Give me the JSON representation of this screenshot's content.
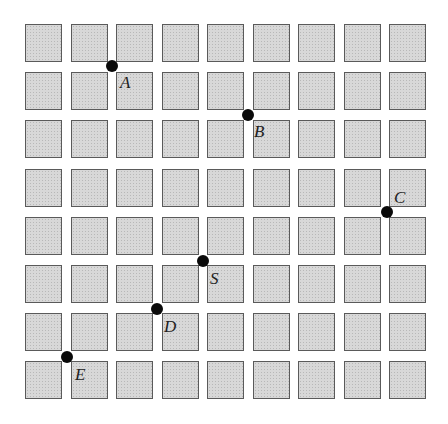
{
  "diagram": {
    "type": "grid-of-squares",
    "columns": 9,
    "rows": 8,
    "colors": {
      "square_fill": "#d8d8d8",
      "square_border": "#5a5a5a",
      "dot": "#0a0a0a",
      "label": "#222222"
    },
    "points": [
      {
        "label": "A",
        "col_gap": 2,
        "row_gap": 1,
        "x": 112,
        "y": 66,
        "label_pos": "below-right"
      },
      {
        "label": "B",
        "col_gap": 5,
        "row_gap": 2,
        "x": 248,
        "y": 115,
        "label_pos": "below-right"
      },
      {
        "label": "C",
        "col_gap": 8,
        "row_gap": 4,
        "x": 387,
        "y": 212,
        "label_pos": "above-right"
      },
      {
        "label": "S",
        "col_gap": 4,
        "row_gap": 5,
        "x": 203,
        "y": 261,
        "label_pos": "below-right"
      },
      {
        "label": "D",
        "col_gap": 3,
        "row_gap": 6,
        "x": 157,
        "y": 309,
        "label_pos": "below-right"
      },
      {
        "label": "E",
        "col_gap": 1,
        "row_gap": 7,
        "x": 67,
        "y": 357,
        "label_pos": "below-right"
      }
    ]
  }
}
